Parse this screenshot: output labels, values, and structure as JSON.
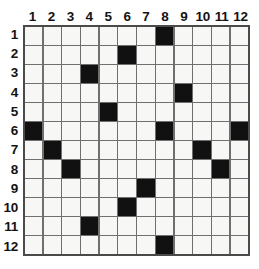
{
  "grid": {
    "rows": 12,
    "cols": 12,
    "column_headers": [
      "1",
      "2",
      "3",
      "4",
      "5",
      "6",
      "7",
      "8",
      "9",
      "10",
      "11",
      "12"
    ],
    "row_headers": [
      "1",
      "2",
      "3",
      "4",
      "5",
      "6",
      "7",
      "8",
      "9",
      "10",
      "11",
      "12"
    ],
    "filled_color": "#111111",
    "empty_color": "#f7f7f5",
    "line_color": "#6f6f6f",
    "border_color": "#4a4a4a",
    "filled_cells": [
      {
        "row": 1,
        "col": 8
      },
      {
        "row": 2,
        "col": 6
      },
      {
        "row": 3,
        "col": 4
      },
      {
        "row": 4,
        "col": 9
      },
      {
        "row": 5,
        "col": 5
      },
      {
        "row": 6,
        "col": 1
      },
      {
        "row": 6,
        "col": 8
      },
      {
        "row": 6,
        "col": 12
      },
      {
        "row": 7,
        "col": 2
      },
      {
        "row": 7,
        "col": 10
      },
      {
        "row": 8,
        "col": 3
      },
      {
        "row": 8,
        "col": 11
      },
      {
        "row": 9,
        "col": 7
      },
      {
        "row": 10,
        "col": 6
      },
      {
        "row": 11,
        "col": 4
      },
      {
        "row": 12,
        "col": 8
      }
    ],
    "matrix": [
      [
        0,
        0,
        0,
        0,
        0,
        0,
        0,
        1,
        0,
        0,
        0,
        0
      ],
      [
        0,
        0,
        0,
        0,
        0,
        1,
        0,
        0,
        0,
        0,
        0,
        0
      ],
      [
        0,
        0,
        0,
        1,
        0,
        0,
        0,
        0,
        0,
        0,
        0,
        0
      ],
      [
        0,
        0,
        0,
        0,
        0,
        0,
        0,
        0,
        1,
        0,
        0,
        0
      ],
      [
        0,
        0,
        0,
        0,
        1,
        0,
        0,
        0,
        0,
        0,
        0,
        0
      ],
      [
        1,
        0,
        0,
        0,
        0,
        0,
        0,
        1,
        0,
        0,
        0,
        1
      ],
      [
        0,
        1,
        0,
        0,
        0,
        0,
        0,
        0,
        0,
        1,
        0,
        0
      ],
      [
        0,
        0,
        1,
        0,
        0,
        0,
        0,
        0,
        0,
        0,
        1,
        0
      ],
      [
        0,
        0,
        0,
        0,
        0,
        0,
        1,
        0,
        0,
        0,
        0,
        0
      ],
      [
        0,
        0,
        0,
        0,
        0,
        1,
        0,
        0,
        0,
        0,
        0,
        0
      ],
      [
        0,
        0,
        0,
        1,
        0,
        0,
        0,
        0,
        0,
        0,
        0,
        0
      ],
      [
        0,
        0,
        0,
        0,
        0,
        0,
        0,
        1,
        0,
        0,
        0,
        0
      ]
    ]
  }
}
